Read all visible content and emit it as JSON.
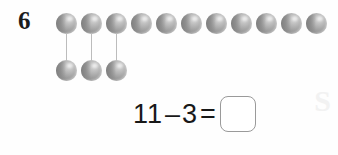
{
  "worksheet": {
    "problem_number": "6",
    "background_color": "#ffffff",
    "counter_color": "#9e9e9e",
    "connector_color": "#bcbcbc",
    "watermark_text": "S"
  },
  "counters": {
    "top_row_label": "top-counter-row",
    "top_row_count": 11,
    "bottom_row_label": "bottom-counter-row",
    "bottom_row_count": 3,
    "connector_count": 3,
    "counter_diameter_px": 21,
    "counter_spacing_px": 25
  },
  "equation": {
    "minuend": "11",
    "operator_minus": "–",
    "subtrahend": "3",
    "operator_equals": "=",
    "answer_value": "",
    "answer_placeholder": ""
  },
  "chart_data": {
    "type": "bar",
    "title": "11 – 3 =",
    "categories": [
      "total counters",
      "crossed off (moved down)",
      "remaining"
    ],
    "values": [
      11,
      3,
      8
    ],
    "xlabel": "",
    "ylabel": "counters",
    "ylim": [
      0,
      11
    ]
  }
}
